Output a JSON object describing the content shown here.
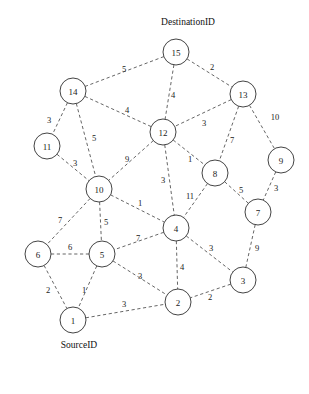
{
  "diagram": {
    "title_top": "DestinationID",
    "title_bottom": "SourceID",
    "edge_color": "#4a4a4a",
    "node_stroke_color": "#3a3a3a",
    "node_fill_color": "#ffffff",
    "background_color": "#ffffff",
    "node_radius": 13
  },
  "annotations": [
    {
      "id": "destination-label",
      "text": "DestinationID",
      "x": 188,
      "y": 22
    },
    {
      "id": "source-label",
      "text": "SourceID",
      "x": 79,
      "y": 345
    }
  ],
  "nodes": [
    {
      "id": "15",
      "label": "15",
      "x": 176,
      "y": 52
    },
    {
      "id": "14",
      "label": "14",
      "x": 73,
      "y": 91
    },
    {
      "id": "13",
      "label": "13",
      "x": 243,
      "y": 94
    },
    {
      "id": "12",
      "label": "12",
      "x": 163,
      "y": 132
    },
    {
      "id": "11",
      "label": "11",
      "x": 47,
      "y": 146
    },
    {
      "id": "9",
      "label": "9",
      "x": 281,
      "y": 160
    },
    {
      "id": "8",
      "label": "8",
      "x": 215,
      "y": 173
    },
    {
      "id": "10",
      "label": "10",
      "x": 99,
      "y": 189
    },
    {
      "id": "7",
      "label": "7",
      "x": 258,
      "y": 212
    },
    {
      "id": "4",
      "label": "4",
      "x": 176,
      "y": 228
    },
    {
      "id": "6",
      "label": "6",
      "x": 38,
      "y": 254
    },
    {
      "id": "5",
      "label": "5",
      "x": 102,
      "y": 254
    },
    {
      "id": "3",
      "label": "3",
      "x": 243,
      "y": 280
    },
    {
      "id": "2",
      "label": "2",
      "x": 178,
      "y": 302
    },
    {
      "id": "1",
      "label": "1",
      "x": 73,
      "y": 320
    }
  ],
  "edges": [
    {
      "from": "15",
      "to": "14",
      "weight": "5",
      "lx": 124,
      "ly": 69
    },
    {
      "from": "15",
      "to": "13",
      "weight": "2",
      "lx": 212,
      "ly": 67
    },
    {
      "from": "15",
      "to": "12",
      "weight": "4",
      "lx": 173,
      "ly": 95
    },
    {
      "from": "14",
      "to": "12",
      "weight": "4",
      "lx": 127,
      "ly": 110
    },
    {
      "from": "14",
      "to": "11",
      "weight": "3",
      "lx": 49,
      "ly": 120
    },
    {
      "from": "14",
      "to": "10",
      "weight": "5",
      "lx": 94,
      "ly": 138
    },
    {
      "from": "13",
      "to": "12",
      "weight": "3",
      "lx": 204,
      "ly": 123
    },
    {
      "from": "13",
      "to": "8",
      "weight": "7",
      "lx": 232,
      "ly": 140
    },
    {
      "from": "13",
      "to": "9",
      "weight": "10",
      "lx": 275,
      "ly": 117
    },
    {
      "from": "11",
      "to": "10",
      "weight": "3",
      "lx": 75,
      "ly": 163
    },
    {
      "from": "12",
      "to": "10",
      "weight": "9",
      "lx": 127,
      "ly": 159
    },
    {
      "from": "12",
      "to": "4",
      "weight": "3",
      "lx": 163,
      "ly": 180
    },
    {
      "from": "12",
      "to": "8",
      "weight": "1",
      "lx": 190,
      "ly": 159
    },
    {
      "from": "9",
      "to": "7",
      "weight": "3",
      "lx": 276,
      "ly": 188
    },
    {
      "from": "8",
      "to": "7",
      "weight": "5",
      "lx": 241,
      "ly": 190
    },
    {
      "from": "8",
      "to": "4",
      "weight": "11",
      "lx": 190,
      "ly": 196
    },
    {
      "from": "10",
      "to": "4",
      "weight": "1",
      "lx": 140,
      "ly": 203
    },
    {
      "from": "10",
      "to": "5",
      "weight": "5",
      "lx": 106,
      "ly": 222
    },
    {
      "from": "10",
      "to": "6",
      "weight": "7",
      "lx": 60,
      "ly": 220
    },
    {
      "from": "7",
      "to": "3",
      "weight": "9",
      "lx": 257,
      "ly": 248
    },
    {
      "from": "4",
      "to": "5",
      "weight": "7",
      "lx": 138,
      "ly": 238
    },
    {
      "from": "4",
      "to": "3",
      "weight": "3",
      "lx": 211,
      "ly": 248
    },
    {
      "from": "4",
      "to": "2",
      "weight": "4",
      "lx": 182,
      "ly": 267
    },
    {
      "from": "6",
      "to": "5",
      "weight": "6",
      "lx": 70,
      "ly": 247
    },
    {
      "from": "6",
      "to": "1",
      "weight": "2",
      "lx": 48,
      "ly": 290
    },
    {
      "from": "5",
      "to": "1",
      "weight": "1",
      "lx": 84,
      "ly": 290
    },
    {
      "from": "5",
      "to": "2",
      "weight": "3",
      "lx": 140,
      "ly": 276
    },
    {
      "from": "3",
      "to": "2",
      "weight": "2",
      "lx": 210,
      "ly": 297
    },
    {
      "from": "1",
      "to": "2",
      "weight": "3",
      "lx": 124,
      "ly": 304
    }
  ]
}
